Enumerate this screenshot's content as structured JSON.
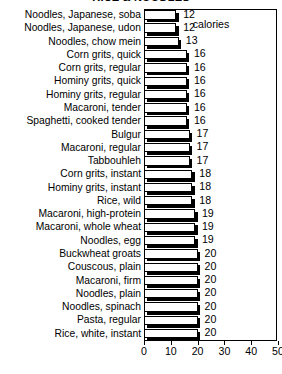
{
  "chart_data": {
    "type": "bar",
    "orientation": "horizontal",
    "title": "RICE & NOODLES",
    "xlabel": "calories",
    "ylabel": "",
    "xlim": [
      0,
      50
    ],
    "xticks": [
      0,
      10,
      20,
      30,
      40,
      50
    ],
    "grid": false,
    "legend": null,
    "value_labels_shown": true,
    "categories": [
      "Noodles, Japanese, soba",
      "Noodles, Japanese, udon",
      "Noodles, chow mein",
      "Corn grits, quick",
      "Corn grits, regular",
      "Hominy grits, quick",
      "Hominy grits, regular",
      "Macaroni, tender",
      "Spaghetti, cooked tender",
      "Bulgur",
      "Macaroni, regular",
      "Tabbouhleh",
      "Corn grits, instant",
      "Hominy grits, instant",
      "Rice, wild",
      "Macaroni, high-protein",
      "Macaroni, whole wheat",
      "Noodles, egg",
      "Buckwheat groats",
      "Couscous, plain",
      "Macaroni, firm",
      "Noodles, plain",
      "Noodles, spinach",
      "Pasta, regular",
      "Rice, white, instant"
    ],
    "values": [
      12,
      12,
      13,
      16,
      16,
      16,
      16,
      16,
      16,
      17,
      17,
      17,
      18,
      18,
      18,
      19,
      19,
      19,
      20,
      20,
      20,
      20,
      20,
      20,
      20
    ]
  },
  "style": {
    "bar_face": "#ffffff",
    "bar_outline": "#000000",
    "bar_shadow": "#000000",
    "axis": "#000000",
    "background": "#ffffff"
  }
}
